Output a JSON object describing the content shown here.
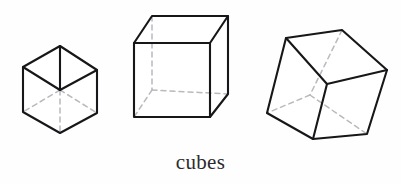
{
  "figure": {
    "caption": "cubes",
    "background_color": "#fffefe",
    "solid_edge_color": "#17171a",
    "hidden_edge_color": "#b9b9be",
    "face_color": "#ffffff",
    "shape_count": 3,
    "shapes": [
      {
        "name": "small-isometric-cube",
        "label": "cube",
        "orientation": "isometric corner-on view, small",
        "outline_points": "60,46 97,70 97,113 60,133 23,112 23,67",
        "visible_edges": [
          "60,46 97,70",
          "97,70 97,113",
          "97,113 60,133",
          "60,133 23,112",
          "23,112 23,67",
          "23,67 60,46",
          "60,46 60,90",
          "60,90 23,67",
          "60,90 97,70"
        ],
        "hidden_edges": [
          "60,90 60,133",
          "60,90 23,112",
          "60,90 97,113"
        ]
      },
      {
        "name": "medium-cabinet-cube",
        "label": "cube",
        "orientation": "front face square with top and right faces receding up-right, medium",
        "outline_points": "134,43 152,16 228,16 228,94 210,117 134,117",
        "visible_edges": [
          "134,43 210,43",
          "210,43 210,117",
          "210,117 134,117",
          "134,117 134,43",
          "134,43 152,16",
          "152,16 228,16",
          "228,16 210,43",
          "228,16 228,94",
          "228,94 210,117"
        ],
        "hidden_edges": [
          "152,16 152,90",
          "152,90 134,117",
          "152,90 228,94"
        ]
      },
      {
        "name": "large-tilted-cube",
        "label": "cube",
        "orientation": "rotated and tilted corner-on view, large",
        "outline_points": "286,38 342,30 387,70 367,134 313,139 267,113",
        "visible_edges": [
          "286,38 342,30",
          "342,30 387,70",
          "387,70 367,134",
          "367,134 313,139",
          "313,139 267,113",
          "267,113 286,38",
          "286,38 327,84",
          "327,84 387,70",
          "327,84 313,139"
        ],
        "hidden_edges": [
          "342,30 310,95",
          "310,95 267,113",
          "310,95 367,134"
        ]
      }
    ]
  }
}
